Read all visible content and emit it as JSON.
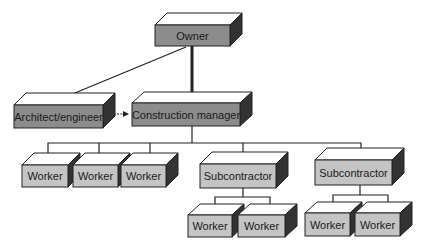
{
  "diagram": {
    "type": "org-chart",
    "nodes": {
      "owner": {
        "label": "Owner",
        "fill": "#8c8c8c"
      },
      "architect": {
        "label": "Architect/engineer",
        "fill": "#8c8c8c"
      },
      "manager": {
        "label": "Construction manager",
        "fill": "#8c8c8c"
      },
      "worker1": {
        "label": "Worker",
        "fill": "#c4c4c4"
      },
      "worker2": {
        "label": "Worker",
        "fill": "#c4c4c4"
      },
      "worker3": {
        "label": "Worker",
        "fill": "#c4c4c4"
      },
      "sub1": {
        "label": "Subcontractor",
        "fill": "#c4c4c4"
      },
      "sub2": {
        "label": "Subcontractor",
        "fill": "#c4c4c4"
      },
      "sub1_worker1": {
        "label": "Worker",
        "fill": "#c4c4c4"
      },
      "sub1_worker2": {
        "label": "Worker",
        "fill": "#c4c4c4"
      },
      "sub2_worker1": {
        "label": "Worker",
        "fill": "#c4c4c4"
      },
      "sub2_worker2": {
        "label": "Worker",
        "fill": "#c4c4c4"
      }
    },
    "edges": [
      {
        "from": "Owner",
        "to": "Construction manager",
        "style": "thick"
      },
      {
        "from": "Owner",
        "to": "Architect/engineer",
        "style": "thin"
      },
      {
        "from": "Architect/engineer",
        "to": "Construction manager",
        "style": "dashed-bidirectional"
      },
      {
        "from": "Construction manager",
        "to": "Worker"
      },
      {
        "from": "Construction manager",
        "to": "Worker"
      },
      {
        "from": "Construction manager",
        "to": "Worker"
      },
      {
        "from": "Construction manager",
        "to": "Subcontractor"
      },
      {
        "from": "Construction manager",
        "to": "Subcontractor"
      },
      {
        "from": "Subcontractor",
        "to": "Worker"
      },
      {
        "from": "Subcontractor",
        "to": "Worker"
      },
      {
        "from": "Subcontractor",
        "to": "Worker"
      },
      {
        "from": "Subcontractor",
        "to": "Worker"
      }
    ]
  }
}
